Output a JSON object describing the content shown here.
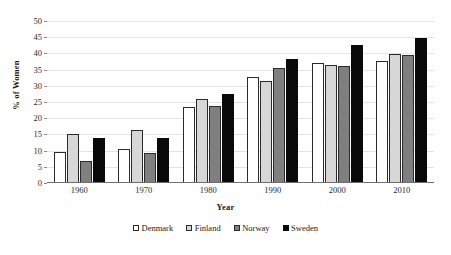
{
  "chart_data": {
    "type": "bar",
    "title": "",
    "xlabel": "Year",
    "ylabel": "% of Women",
    "categories": [
      "1960",
      "1970",
      "1980",
      "1990",
      "2000",
      "2010"
    ],
    "series": [
      {
        "name": "Denmark",
        "color": "#ffffff",
        "values": [
          9.5,
          10.4,
          23.4,
          32.8,
          37.1,
          37.7
        ]
      },
      {
        "name": "Finland",
        "color": "#d7d7d7",
        "values": [
          15.0,
          16.3,
          25.8,
          31.4,
          36.3,
          39.8
        ]
      },
      {
        "name": "Norway",
        "color": "#7f7f7f",
        "values": [
          6.7,
          9.3,
          23.8,
          35.5,
          36.1,
          39.4
        ]
      },
      {
        "name": "Sweden",
        "color": "#0a0a0a",
        "values": [
          13.8,
          14.0,
          27.6,
          38.2,
          42.5,
          44.7
        ]
      }
    ],
    "ylim": [
      0,
      50
    ],
    "y_ticks": [
      "0",
      "5",
      "10",
      "15",
      "20",
      "25",
      "30",
      "35",
      "40",
      "45",
      "50"
    ],
    "grid": true,
    "legend_position": "bottom"
  }
}
